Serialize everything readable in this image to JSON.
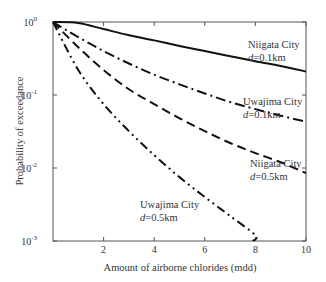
{
  "chart_data": {
    "type": "line",
    "title": "",
    "xlabel": "Amount of airborne chlorides (mdd)",
    "ylabel": "Probability of exceedance",
    "xlim": [
      0,
      10
    ],
    "ylim": [
      0.001,
      1
    ],
    "yscale": "log",
    "grid": false,
    "legend": "none (inline annotations)",
    "x_ticks": [
      2,
      4,
      6,
      8,
      10
    ],
    "y_ticks": [
      {
        "base": "10",
        "exp": "0",
        "value": 1
      },
      {
        "base": "10",
        "exp": "-1",
        "value": 0.1
      },
      {
        "base": "10",
        "exp": "-2",
        "value": 0.01
      },
      {
        "base": "10",
        "exp": "-3",
        "value": 0.001
      }
    ],
    "x": [
      0,
      1,
      2,
      3,
      4,
      5,
      6,
      7,
      8,
      9,
      10
    ],
    "series": [
      {
        "name": "Niigata City d=0.1km",
        "style": "solid",
        "values": [
          1.0,
          0.97,
          0.8,
          0.66,
          0.56,
          0.47,
          0.4,
          0.34,
          0.29,
          0.25,
          0.21
        ]
      },
      {
        "name": "Uwajima City d=0.1km",
        "style": "dash-dot",
        "values": [
          1.0,
          0.62,
          0.4,
          0.27,
          0.19,
          0.14,
          0.105,
          0.08,
          0.064,
          0.052,
          0.043
        ]
      },
      {
        "name": "Niigata City d=0.5km",
        "style": "dashed",
        "values": [
          1.0,
          0.45,
          0.22,
          0.12,
          0.075,
          0.048,
          0.032,
          0.022,
          0.016,
          0.012,
          0.0085
        ]
      },
      {
        "name": "Uwajima City d=0.5km",
        "style": "dash-dot-dot",
        "values": [
          1.0,
          0.22,
          0.075,
          0.032,
          0.015,
          0.0075,
          0.004,
          0.0022,
          0.0012,
          null,
          null
        ]
      }
    ],
    "annotations": [
      {
        "line1": "Niigata City",
        "line2_italic": "d",
        "line2_rest": "=0.1km"
      },
      {
        "line1": "Uwajima City",
        "line2_italic": "d",
        "line2_rest": "=0.1km"
      },
      {
        "line1": "Niigata City",
        "line2_italic": "d",
        "line2_rest": "=0.5km"
      },
      {
        "line1": "Uwajima City",
        "line2_italic": "d",
        "line2_rest": "=0.5km"
      }
    ]
  }
}
